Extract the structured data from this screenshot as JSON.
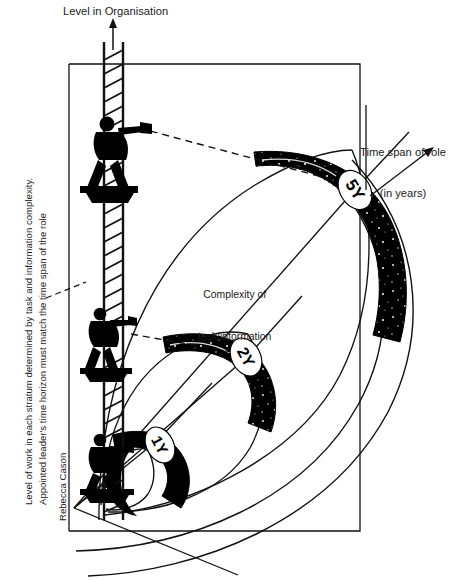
{
  "diagram": {
    "title_axis_vertical": "Level in Organisation",
    "axis_time": {
      "line1": "Time span of role",
      "line2": "(in years)"
    },
    "center_label": {
      "line1": "Complexity of",
      "line2": "task/information"
    },
    "side_note": "Level of work in each stratum determined by task and information complexity.\nAppointed leader's time horizon must match the time span of the role",
    "side_note_line1": "Level of work in each stratum determined by task and information complexity.",
    "side_note_line2": "Appointed leader's time horizon must match the time span of the role",
    "credit": "Rebecca Cason",
    "colors": {
      "ink": "#000000",
      "paper": "#ffffff",
      "text": "#1b1b1b"
    },
    "strata": [
      {
        "id": "stratum-1",
        "badge": "1Y",
        "years": 1,
        "level": 1
      },
      {
        "id": "stratum-2",
        "badge": "2Y",
        "years": 2,
        "level": 2
      },
      {
        "id": "stratum-3",
        "badge": "5Y",
        "years": 5,
        "level": 3
      }
    ],
    "icons": {
      "axis_arrow": "up-arrow-icon",
      "time_arrow": "arrow-up-right-icon",
      "ladder": "ladder-icon",
      "climber": "climber-with-spyglass-icon"
    }
  }
}
